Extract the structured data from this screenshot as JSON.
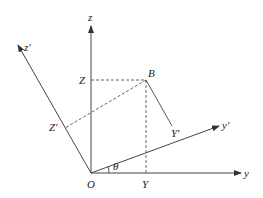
{
  "diagram": {
    "type": "coordinate-rotation",
    "colors": {
      "line": "#444444",
      "dashed": "#555555",
      "text": "#222222",
      "background": "#ffffff"
    },
    "labels": {
      "z_axis": "z",
      "z_prime_axis": "z'",
      "y_axis": "y",
      "y_prime_axis": "y'",
      "origin": "O",
      "point_B": "B",
      "point_Z": "Z",
      "point_Z_prime": "Z'",
      "point_Y": "Y",
      "point_Y_prime": "Y'",
      "angle": "θ"
    }
  }
}
